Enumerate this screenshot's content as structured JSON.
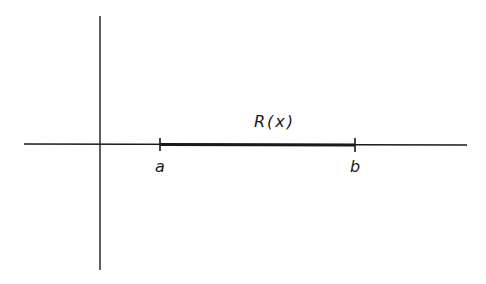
{
  "diagram": {
    "type": "number-line-interval",
    "labels": {
      "function": "R(x)",
      "left_endpoint": "a",
      "right_endpoint": "b"
    },
    "colors": {
      "ink": "#1a1a1a",
      "background": "#ffffff"
    },
    "geometry": {
      "origin": [
        100,
        144
      ],
      "x_axis": {
        "x1": 24,
        "x2": 467,
        "y": 144
      },
      "y_axis": {
        "x": 100,
        "y1": 16,
        "y2": 270
      },
      "interval": {
        "x_a": 160,
        "x_b": 355
      }
    }
  }
}
